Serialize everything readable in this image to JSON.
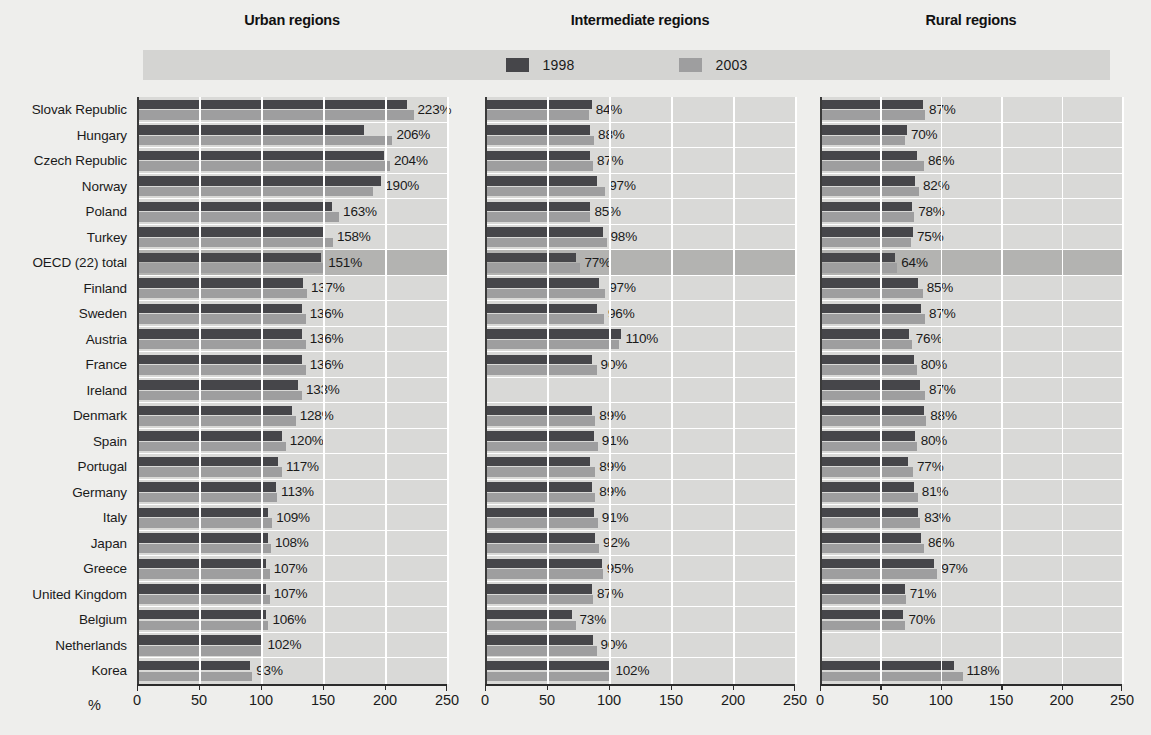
{
  "chart_data": {
    "type": "bar",
    "orientation": "horizontal",
    "title": "",
    "xlabel": "%",
    "ylabel": "",
    "xlim": [
      0,
      250
    ],
    "xticks": [
      0,
      50,
      100,
      150,
      200,
      250
    ],
    "grid": true,
    "legend_position": "top-center",
    "value_suffix": "%",
    "highlight_category": "OECD (22) total",
    "panels": [
      {
        "name": "urban",
        "title": "Urban regions"
      },
      {
        "name": "intermediate",
        "title": "Intermediate regions"
      },
      {
        "name": "rural",
        "title": "Rural regions"
      }
    ],
    "legend": [
      {
        "label": "1998",
        "color": "#46464a"
      },
      {
        "label": "2003",
        "color": "#9e9e9f"
      }
    ],
    "categories": [
      "Slovak Republic",
      "Hungary",
      "Czech Republic",
      "Norway",
      "Poland",
      "Turkey",
      "OECD (22) total",
      "Finland",
      "Sweden",
      "Austria",
      "France",
      "Ireland",
      "Denmark",
      "Spain",
      "Portugal",
      "Germany",
      "Italy",
      "Japan",
      "Greece",
      "United Kingdom",
      "Belgium",
      "Netherlands",
      "Korea"
    ],
    "urban": {
      "label_values": [
        "223%",
        "206%",
        "204%",
        "190%",
        "163%",
        "158%",
        "151%",
        "137%",
        "136%",
        "136%",
        "136%",
        "133%",
        "128%",
        "120%",
        "117%",
        "113%",
        "109%",
        "108%",
        "107%",
        "107%",
        "106%",
        "102%",
        "93%"
      ],
      "series": [
        {
          "name": "1998",
          "values": [
            218,
            183,
            199,
            197,
            157,
            152,
            148,
            134,
            133,
            133,
            133,
            130,
            125,
            117,
            114,
            112,
            106,
            106,
            104,
            104,
            104,
            100,
            91
          ]
        },
        {
          "name": "2003",
          "values": [
            223,
            206,
            204,
            190,
            163,
            158,
            151,
            137,
            136,
            136,
            136,
            133,
            128,
            120,
            117,
            113,
            109,
            108,
            107,
            107,
            106,
            102,
            93
          ]
        }
      ]
    },
    "intermediate": {
      "label_values": [
        "84%",
        "88%",
        "87%",
        "97%",
        "85%",
        "98%",
        "77%",
        "97%",
        "96%",
        "110%",
        "90%",
        "",
        "89%",
        "91%",
        "89%",
        "89%",
        "91%",
        "92%",
        "95%",
        "87%",
        "73%",
        "90%",
        "102%"
      ],
      "series": [
        {
          "name": "1998",
          "values": [
            86,
            85,
            85,
            90,
            85,
            95,
            73,
            92,
            90,
            110,
            86,
            0,
            86,
            88,
            85,
            86,
            88,
            89,
            94,
            86,
            70,
            87,
            102
          ]
        },
        {
          "name": "2003",
          "values": [
            84,
            88,
            87,
            97,
            85,
            98,
            77,
            97,
            96,
            108,
            90,
            0,
            89,
            91,
            89,
            89,
            91,
            92,
            95,
            87,
            73,
            90,
            100
          ]
        }
      ]
    },
    "rural": {
      "label_values": [
        "87%",
        "70%",
        "86%",
        "82%",
        "78%",
        "75%",
        "64%",
        "85%",
        "87%",
        "76%",
        "80%",
        "87%",
        "88%",
        "80%",
        "77%",
        "81%",
        "83%",
        "86%",
        "97%",
        "71%",
        "70%",
        "",
        "118%"
      ],
      "series": [
        {
          "name": "1998",
          "values": [
            85,
            72,
            80,
            79,
            76,
            77,
            62,
            81,
            84,
            74,
            78,
            83,
            86,
            79,
            73,
            78,
            81,
            84,
            94,
            70,
            69,
            0,
            111
          ]
        },
        {
          "name": "2003",
          "values": [
            87,
            70,
            86,
            82,
            78,
            75,
            64,
            85,
            87,
            76,
            80,
            87,
            88,
            80,
            77,
            81,
            83,
            86,
            97,
            71,
            70,
            0,
            118
          ]
        }
      ]
    }
  }
}
